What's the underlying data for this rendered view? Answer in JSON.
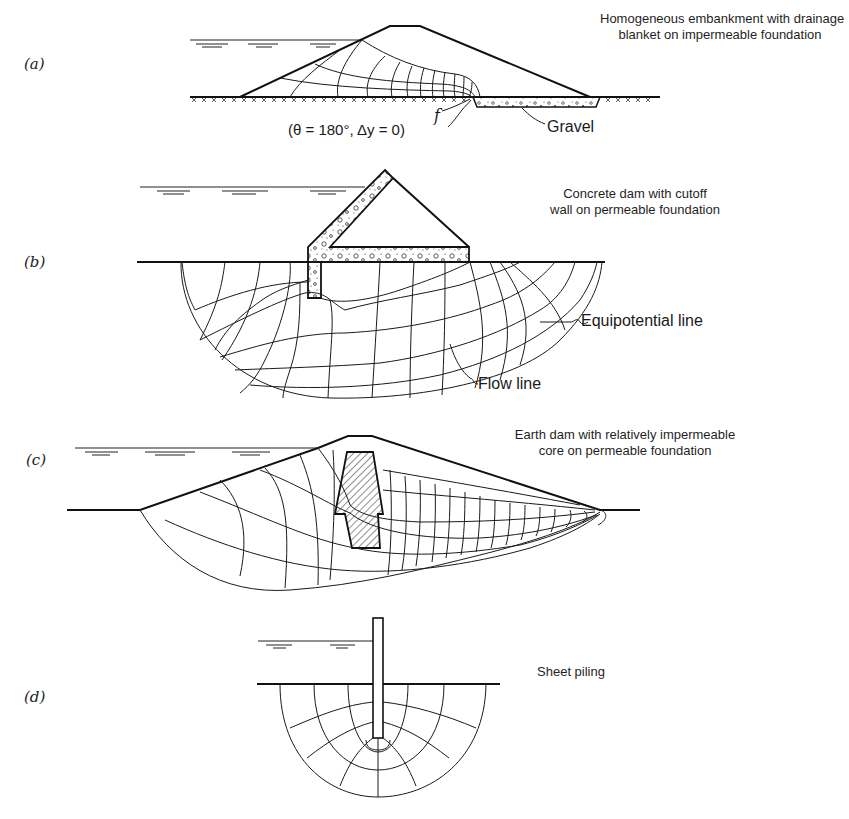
{
  "figure": {
    "panels": [
      {
        "id": "a",
        "label": "(a)",
        "caption_line1": "Homogeneous embankment with drainage",
        "caption_line2": "blanket on impermeable foundation",
        "callouts": {
          "f": "f",
          "condition": "(θ = 180°, Δy = 0)",
          "gravel": "Gravel"
        }
      },
      {
        "id": "b",
        "label": "(b)",
        "caption_line1": "Concrete dam with cutoff",
        "caption_line2": "wall on permeable foundation",
        "callouts": {
          "equipotential": "Equipotential line",
          "flow": "Flow line"
        }
      },
      {
        "id": "c",
        "label": "(c)",
        "caption_line1": "Earth dam with relatively impermeable",
        "caption_line2": "core on permeable foundation"
      },
      {
        "id": "d",
        "label": "(d)",
        "caption_line1": "Sheet piling"
      }
    ]
  }
}
